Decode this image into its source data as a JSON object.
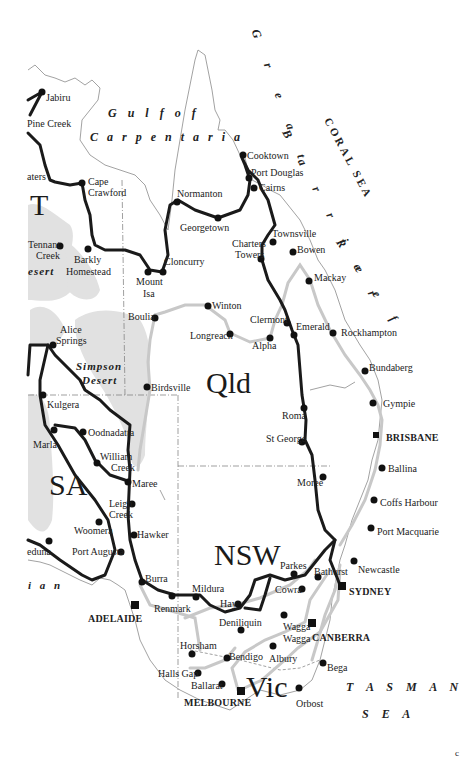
{
  "map": {
    "title": "Eastern Australia route map",
    "colors": {
      "route": "#1a1a1a",
      "alt_route": "#c8c8c8",
      "coast": "#8a8a8a",
      "desert_stipple": "#d9d9d9",
      "text": "#222222"
    },
    "water_labels": {
      "gulf_line1": "G u l f   o f",
      "gulf_line2": "C a r p e n t a r i a",
      "great": "G r e a t",
      "barrier": "B a r r i e r",
      "reef": "R e e f",
      "coral_sea": "CORAL SEA",
      "tasman": "T A S M A N",
      "tasman_sea": "S E A",
      "southern_fragment": "i a n"
    },
    "region_labels": {
      "nt": "T",
      "qld": "Qld",
      "sa": "SA",
      "nsw": "NSW",
      "vic": "Vic",
      "desert_fragment": "esert",
      "simpson_line1": "Simpson",
      "simpson_line2": "Desert"
    },
    "capitals": [
      {
        "name": "BRISBANE"
      },
      {
        "name": "SYDNEY"
      },
      {
        "name": "CANBERRA"
      },
      {
        "name": "ADELAIDE"
      },
      {
        "name": "MELBOURNE"
      }
    ],
    "towns": [
      "Jabiru",
      "Pine Creek",
      "aters",
      "Cape",
      "Crawford",
      "Tennant",
      "Creek",
      "Barkly",
      "Homestead",
      "Normanton",
      "Georgetown",
      "Cloncurry",
      "Mount",
      "Isa",
      "Cooktown",
      "Port Douglas",
      "Cairns",
      "Townsville",
      "Charters",
      "Towers",
      "Bowen",
      "Mackay",
      "Winton",
      "Longreach",
      "Clermont",
      "Alpha",
      "Emerald",
      "Rockhampton",
      "Bundaberg",
      "Boulia",
      "Alice",
      "Springs",
      "Birdsville",
      "Gympie",
      "Roma",
      "St George",
      "Kulgera",
      "Oodnadatta",
      "Marla",
      "William",
      "Creek",
      "Maree",
      "Leigh",
      "Creek",
      "Ballina",
      "Moree",
      "Coffs Harbour",
      "Port Macquarie",
      "Hawker",
      "Woomera",
      "eduna",
      "Port Augusta",
      "Newcastle",
      "Parkes",
      "Bathurst",
      "Cowra",
      "Burra",
      "Mildura",
      "Renmark",
      "Hay",
      "Deniliquin",
      "Wagga",
      "Wagga",
      "Horsham",
      "Bendigo",
      "Albury",
      "Bega",
      "Halls Gap",
      "Ballarat",
      "Orbost"
    ],
    "corner_mark": "c"
  }
}
